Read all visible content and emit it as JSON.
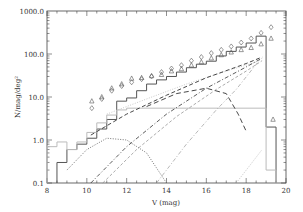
{
  "chart_data": {
    "type": "line",
    "title": "",
    "xlabel": "V (mag)",
    "ylabel": "N/mag/deg²",
    "xlim": [
      8,
      20
    ],
    "ylim": [
      0.1,
      1000.0
    ],
    "yscale": "log",
    "grid": false,
    "legend": null,
    "x_ticks": [
      "8",
      "10",
      "12",
      "14",
      "16",
      "18",
      "20"
    ],
    "y_ticks": [
      "0.1",
      "1.0",
      "10.0",
      "100.0",
      "1000.0"
    ],
    "series": [
      {
        "name": "observed histogram (solid, dark)",
        "style": "step-solid",
        "color": "#555555",
        "x_edges": [
          8.5,
          9.0,
          9.5,
          10.0,
          10.5,
          11.0,
          11.5,
          12.0,
          12.5,
          13.0,
          13.5,
          14.0,
          14.5,
          15.0,
          15.5,
          16.0,
          16.5,
          17.0,
          17.5,
          18.0,
          18.5,
          19.0,
          19.5
        ],
        "values": [
          0.3,
          0.6,
          0.8,
          1.1,
          1.8,
          3.0,
          8.0,
          9.5,
          14,
          20,
          25,
          30,
          38,
          48,
          58,
          68,
          90,
          115,
          145,
          180,
          260,
          2.0
        ]
      },
      {
        "name": "model histogram (solid, light gray)",
        "style": "step-solid",
        "color": "#bbbbbb",
        "x_edges": [
          8.0,
          8.5,
          9.0,
          9.5,
          10.0,
          10.5,
          11.0,
          11.5,
          12.0,
          19.0,
          19.5
        ],
        "values": [
          0.7,
          0.9,
          0.6,
          0.9,
          1.5,
          2.5,
          3.8,
          5.0,
          5.5,
          0.2
        ]
      },
      {
        "name": "diamonds",
        "style": "marker-diamond",
        "x": [
          10.25,
          10.75,
          11.25,
          11.75,
          12.25,
          12.75,
          13.25,
          13.75,
          14.25,
          14.75,
          15.25,
          15.75,
          16.25,
          16.75,
          17.25,
          17.75,
          18.25,
          18.75,
          19.25
        ],
        "values": [
          5.5,
          9.0,
          14,
          18,
          22,
          26,
          30,
          38,
          46,
          55,
          70,
          85,
          105,
          125,
          150,
          185,
          230,
          310,
          420
        ]
      },
      {
        "name": "triangles",
        "style": "marker-triangle",
        "x": [
          10.25,
          10.75,
          11.25,
          11.75,
          12.25,
          12.75,
          13.25,
          13.75,
          14.25,
          14.75,
          15.25,
          15.75,
          16.25,
          16.75,
          17.25,
          17.75,
          18.25,
          18.75,
          19.25,
          19.35
        ],
        "values": [
          8.0,
          10,
          16,
          20,
          27,
          28,
          31,
          33,
          40,
          45,
          55,
          65,
          80,
          95,
          110,
          125,
          140,
          170,
          230,
          3.0
        ]
      },
      {
        "name": "component (dotted, light)",
        "style": "dotted-light",
        "points": [
          [
            11.0,
            4.0
          ],
          [
            13.0,
            9.0
          ],
          [
            15.0,
            20.0
          ],
          [
            17.0,
            40.0
          ],
          [
            18.5,
            65.0
          ]
        ]
      },
      {
        "name": "component (dashed)",
        "style": "dashed",
        "points": [
          [
            10.2,
            1.3
          ],
          [
            12.0,
            4.0
          ],
          [
            14.0,
            11.0
          ],
          [
            16.0,
            28.0
          ],
          [
            18.0,
            60.0
          ],
          [
            18.8,
            85.0
          ]
        ]
      },
      {
        "name": "component (dash-dot)",
        "style": "dash-dot",
        "points": [
          [
            10.2,
            0.1
          ],
          [
            12.0,
            0.7
          ],
          [
            14.0,
            4.0
          ],
          [
            16.0,
            16.0
          ],
          [
            18.0,
            50.0
          ],
          [
            18.8,
            80.0
          ]
        ]
      },
      {
        "name": "component (dashed, light)",
        "style": "dashed-light",
        "points": [
          [
            10.8,
            0.1
          ],
          [
            12.5,
            0.6
          ],
          [
            14.5,
            3.5
          ],
          [
            16.5,
            15.0
          ],
          [
            18.0,
            40.0
          ],
          [
            18.8,
            70.0
          ]
        ]
      },
      {
        "name": "component (long-dash curve)",
        "style": "long-dash",
        "points": [
          [
            13.0,
            6.0
          ],
          [
            14.5,
            12.0
          ],
          [
            16.0,
            16.0
          ],
          [
            17.0,
            12.0
          ],
          [
            17.6,
            4.0
          ],
          [
            18.0,
            1.6
          ]
        ]
      },
      {
        "name": "component (dotted arc)",
        "style": "dotted",
        "points": [
          [
            9.0,
            0.2
          ],
          [
            10.0,
            0.6
          ],
          [
            11.0,
            1.1
          ],
          [
            12.0,
            1.0
          ],
          [
            13.0,
            0.5
          ],
          [
            14.0,
            0.1
          ]
        ]
      },
      {
        "name": "component (dash-dot, light, steep)",
        "style": "dash-dot-light",
        "points": [
          [
            13.5,
            0.1
          ],
          [
            15.0,
            0.8
          ],
          [
            16.5,
            5.0
          ],
          [
            17.5,
            15.0
          ],
          [
            18.7,
            75.0
          ]
        ]
      },
      {
        "name": "component (dotted, faint, late)",
        "style": "dotted-faint",
        "points": [
          [
            17.5,
            0.1
          ],
          [
            18.3,
            0.3
          ],
          [
            18.8,
            0.6
          ]
        ]
      }
    ]
  }
}
